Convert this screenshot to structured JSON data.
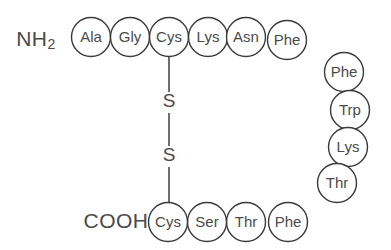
{
  "diagram": {
    "type": "peptide-chain-structure",
    "canvas": {
      "width": 391,
      "height": 250,
      "background": "#ffffff"
    },
    "style": {
      "circle_fill": "#ffffff",
      "circle_stroke": "#3a3a3a",
      "text_color": "#4a4a4a",
      "bond_color": "#4a4a4a",
      "circle_radius": 19.5
    },
    "termini": {
      "n_terminus": {
        "text": "NH",
        "subscript": "2",
        "x": 41,
        "y": 40
      },
      "c_terminus": {
        "text": "COOH",
        "x": 116,
        "y": 222
      }
    },
    "residues": [
      {
        "id": "res-1",
        "label": "Ala",
        "x": 91,
        "y": 37,
        "r": 19.5
      },
      {
        "id": "res-2",
        "label": "Gly",
        "x": 130,
        "y": 37,
        "r": 19.5
      },
      {
        "id": "res-3",
        "label": "Cys",
        "x": 169,
        "y": 37,
        "r": 19.5
      },
      {
        "id": "res-4",
        "label": "Lys",
        "x": 208,
        "y": 37,
        "r": 19.5
      },
      {
        "id": "res-5",
        "label": "Asn",
        "x": 246,
        "y": 37,
        "r": 19.5
      },
      {
        "id": "res-6",
        "label": "Phe",
        "x": 287,
        "y": 40,
        "r": 19.5
      },
      {
        "id": "res-7",
        "label": "Phe",
        "x": 344,
        "y": 72,
        "r": 19.5
      },
      {
        "id": "res-8",
        "label": "Trp",
        "x": 350,
        "y": 110,
        "r": 19.5
      },
      {
        "id": "res-9",
        "label": "Lys",
        "x": 348,
        "y": 147,
        "r": 19.5
      },
      {
        "id": "res-10",
        "label": "Thr",
        "x": 337,
        "y": 183,
        "r": 19.5
      },
      {
        "id": "res-11",
        "label": "Phe",
        "x": 288,
        "y": 222,
        "r": 19.5
      },
      {
        "id": "res-12",
        "label": "Thr",
        "x": 246,
        "y": 222,
        "r": 19.5
      },
      {
        "id": "res-13",
        "label": "Ser",
        "x": 207,
        "y": 222,
        "r": 19.5
      },
      {
        "id": "res-14",
        "label": "Cys",
        "x": 168,
        "y": 222,
        "r": 19.5
      }
    ],
    "disulfide_bridge": {
      "name": "disulfide-bond",
      "from_residue": "res-3",
      "to_residue": "res-14",
      "x": 169,
      "segments": [
        {
          "y1": 57,
          "y2": 92
        },
        {
          "y1": 113,
          "y2": 146
        },
        {
          "y1": 167,
          "y2": 202
        }
      ],
      "sulfur_atoms": [
        {
          "label": "S",
          "x": 169,
          "y": 102
        },
        {
          "label": "S",
          "x": 169,
          "y": 156
        }
      ]
    }
  }
}
